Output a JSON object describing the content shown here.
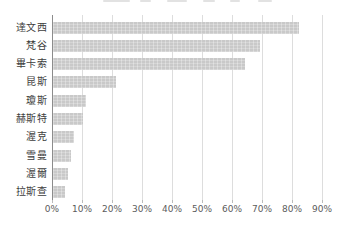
{
  "chart_data": {
    "type": "bar",
    "orientation": "horizontal",
    "title": "",
    "categories": [
      "達文西",
      "梵谷",
      "畢卡索",
      "昆斯",
      "瓊斯",
      "赫斯特",
      "渥克",
      "雪曼",
      "渥爾",
      "拉斯查"
    ],
    "values": [
      82,
      69,
      64,
      21,
      11,
      10,
      7,
      6,
      5,
      4
    ],
    "unit": "%",
    "x_ticks": [
      "0%",
      "10%",
      "20%",
      "30%",
      "40%",
      "50%",
      "60%",
      "70%",
      "80%",
      "90%"
    ],
    "x_tick_values": [
      0,
      10,
      20,
      30,
      40,
      50,
      60,
      70,
      80,
      90
    ],
    "xlim": [
      0,
      90
    ],
    "grid": true,
    "legend": "none"
  },
  "colors": {
    "bar": "#c9c9c9",
    "gridline": "#dddddd",
    "axis_line": "#8c8c8c",
    "category_label": "#3d3d3d",
    "tick_label": "#5c5c5c",
    "background": "#ffffff"
  }
}
